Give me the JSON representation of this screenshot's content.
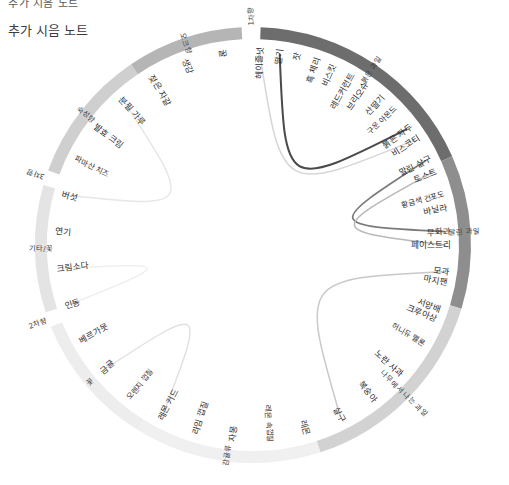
{
  "header": {
    "clipped_line": "추가 시음 노트",
    "subtitle": "추가 시음 노트"
  },
  "chart_data": {
    "type": "pie",
    "title": "추가 시음 노트",
    "subtitle": "",
    "xlabel": "",
    "ylabel": "",
    "legend_position": "none",
    "grid": false,
    "outer_groups": [
      {
        "label": "1차향",
        "start_deg": -3,
        "end_deg": 2,
        "color": "#ffffff",
        "text_color": "#3a3a3a",
        "tick": true
      },
      {
        "label": "붉은 과일",
        "start_deg": 2,
        "end_deg": 66,
        "color": "#6d6d6d",
        "text_color": "#ffffff"
      },
      {
        "label": "말린 과일",
        "start_deg": 66,
        "end_deg": 107,
        "color": "#8e8e8e",
        "text_color": "#ffffff"
      },
      {
        "label": "나무에서 나는 과일",
        "start_deg": 107,
        "end_deg": 162,
        "color": "#d2d2d2",
        "text_color": "#3a3a3a"
      },
      {
        "label": "감귤류",
        "start_deg": 162,
        "end_deg": 212,
        "color": "#f0f0f0",
        "text_color": "#3a3a3a"
      },
      {
        "label": "꽃",
        "start_deg": 212,
        "end_deg": 248,
        "color": "#ededed",
        "text_color": "#3a3a3a"
      },
      {
        "label": "2차향",
        "start_deg": 248,
        "end_deg": 252,
        "color": "#ffffff",
        "text_color": "#3a3a3a",
        "tick": true
      },
      {
        "label": "기타/꽃",
        "start_deg": 252,
        "end_deg": 286,
        "color": "#e4e4e4",
        "text_color": "#3a3a3a"
      },
      {
        "label": "3차향",
        "start_deg": 286,
        "end_deg": 290,
        "color": "#ffffff",
        "text_color": "#3a3a3a",
        "tick": true
      },
      {
        "label": "숙성향",
        "start_deg": 290,
        "end_deg": 326,
        "color": "#cfcfcf",
        "text_color": "#3a3a3a"
      },
      {
        "label": "오크향",
        "start_deg": 326,
        "end_deg": 357,
        "color": "#b5b5b5",
        "text_color": "#3a3a3a"
      }
    ],
    "leaf_nodes": [
      {
        "label": "딸기",
        "angle_deg": 8,
        "group": "붉은 과일"
      },
      {
        "label": "흑 체리",
        "angle_deg": 19,
        "group": "붉은 과일"
      },
      {
        "label": "레드커런트",
        "angle_deg": 30,
        "group": "붉은 과일"
      },
      {
        "label": "산딸기",
        "angle_deg": 41,
        "group": "붉은 과일"
      },
      {
        "label": "붉은 자두",
        "angle_deg": 53,
        "group": "붉은 과일"
      },
      {
        "label": "말린 살구",
        "angle_deg": 64,
        "group": "말린 과일"
      },
      {
        "label": "황금색 건포도",
        "angle_deg": 75,
        "group": "말린 과일"
      },
      {
        "label": "무화과",
        "angle_deg": 86,
        "group": "말린 과일"
      },
      {
        "label": "모과",
        "angle_deg": 98,
        "group": "말린 과일"
      },
      {
        "label": "서양배",
        "angle_deg": 109,
        "group": "나무에서 나는 과일"
      },
      {
        "label": "허니듀 멜론",
        "angle_deg": 120,
        "group": "나무에서 나는 과일"
      },
      {
        "label": "노란 사과",
        "angle_deg": 131,
        "group": "나무에서 나는 과일"
      },
      {
        "label": "복숭아",
        "angle_deg": 142,
        "group": "나무에서 나는 과일"
      },
      {
        "label": "살구",
        "angle_deg": 153,
        "group": "나무에서 나는 과일"
      },
      {
        "label": "레몬",
        "angle_deg": 164,
        "group": "감귤류"
      },
      {
        "label": "레몬 속껍질",
        "angle_deg": 175,
        "group": "감귤류"
      },
      {
        "label": "자몽",
        "angle_deg": 186,
        "group": "감귤류"
      },
      {
        "label": "라임 껍질",
        "angle_deg": 197,
        "group": "감귤류"
      },
      {
        "label": "레몬 커드",
        "angle_deg": 208,
        "group": "감귤류"
      },
      {
        "label": "오렌지 껍질",
        "angle_deg": 219,
        "group": "감귤류"
      },
      {
        "label": "금귤",
        "angle_deg": 230,
        "group": "꽃"
      },
      {
        "label": "베르가못",
        "angle_deg": 241,
        "group": "꽃"
      },
      {
        "label": "인동",
        "angle_deg": 252,
        "group": "꽃"
      },
      {
        "label": "크림소다",
        "angle_deg": 263,
        "group": "기타/꽃"
      },
      {
        "label": "연기",
        "angle_deg": 274,
        "group": "기타/꽃"
      },
      {
        "label": "버섯",
        "angle_deg": 285,
        "group": "기타/꽃"
      },
      {
        "label": "파마산 치즈",
        "angle_deg": 296,
        "group": "기타/꽃"
      },
      {
        "label": "발효 크림",
        "angle_deg": 307,
        "group": "기타/꽃"
      },
      {
        "label": "분필 가루",
        "angle_deg": 318,
        "group": "숙성향"
      },
      {
        "label": "젖은 자갈",
        "angle_deg": 329,
        "group": "숙성향"
      },
      {
        "label": "생강",
        "angle_deg": 340,
        "group": "숙성향"
      },
      {
        "label": "꿀",
        "angle_deg": 351,
        "group": "숙성향"
      },
      {
        "label": "헤이즐넛",
        "angle_deg": 362,
        "group": "숙성향"
      },
      {
        "label": "잣",
        "angle_deg": 373,
        "group": "숙성향"
      },
      {
        "label": "비스킷",
        "angle_deg": 384,
        "group": "오크향"
      },
      {
        "label": "브리오슈",
        "angle_deg": 395,
        "group": "오크향"
      },
      {
        "label": "구운 아몬드",
        "angle_deg": 406,
        "group": "오크향"
      },
      {
        "label": "비스코티",
        "angle_deg": 417,
        "group": "오크향"
      },
      {
        "label": "토스트",
        "angle_deg": 428,
        "group": "오크향"
      },
      {
        "label": "바닐라",
        "angle_deg": 439,
        "group": "오크향"
      },
      {
        "label": "페이스트리",
        "angle_deg": 450,
        "group": "오크향"
      },
      {
        "label": "마지팬",
        "angle_deg": 461,
        "group": "오크향"
      },
      {
        "label": "크루아상",
        "angle_deg": 472,
        "group": "오크향"
      }
    ],
    "ribbons": [
      {
        "from": "딸기",
        "to": "붉은 자두",
        "color": "#4a4a4a",
        "width": 2.0
      },
      {
        "from": "말린 살구",
        "to": "무화과",
        "color": "#7b7b7b",
        "width": 1.7
      },
      {
        "from": "모과",
        "to": "살구",
        "color": "#c9c9c9",
        "width": 1.5
      },
      {
        "from": "레몬 커드",
        "to": "금귤",
        "color": "#e0e0e0",
        "width": 1.4
      },
      {
        "from": "인동",
        "to": "크림소다",
        "color": "#ededed",
        "width": 1.4
      },
      {
        "from": "버섯",
        "to": "분필 가루",
        "color": "#e6e6e6",
        "width": 1.4
      },
      {
        "from": "헤이즐넛",
        "to": "비스코티",
        "color": "#d6d6d6",
        "width": 1.5
      },
      {
        "from": "토스트",
        "to": "페이스트리",
        "color": "#b9b9b9",
        "width": 1.6
      }
    ],
    "center": {
      "cx": 253,
      "cy": 245,
      "r_outer": 218,
      "r_inner": 206
    }
  }
}
